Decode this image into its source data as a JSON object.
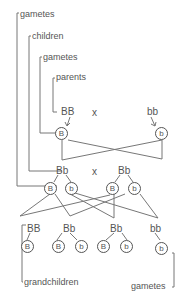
{
  "labels": {
    "gametes_top": "gametes",
    "children": "children",
    "gametes_mid": "gametes",
    "parents": "parents",
    "grandchildren": "grandchildren",
    "gametes_bottom": "gametes"
  },
  "cross_symbol": "x",
  "parents": [
    {
      "genotype": "BB",
      "gamete": "B"
    },
    {
      "genotype": "bb",
      "gamete": "b"
    }
  ],
  "children": [
    {
      "genotype": "Bb",
      "gametes": [
        "B",
        "b"
      ]
    },
    {
      "genotype": "Bb",
      "gametes": [
        "B",
        "b"
      ]
    }
  ],
  "grandchildren": [
    {
      "genotype": "BB",
      "gametes": [
        "B"
      ]
    },
    {
      "genotype": "Bb",
      "gametes": [
        "B",
        "b"
      ]
    },
    {
      "genotype": "Bb",
      "gametes": [
        "B",
        "b"
      ]
    },
    {
      "genotype": "bb",
      "gametes": [
        "b"
      ]
    }
  ],
  "colors": {
    "line": "#666666",
    "text": "#555555",
    "background": "#ffffff"
  }
}
